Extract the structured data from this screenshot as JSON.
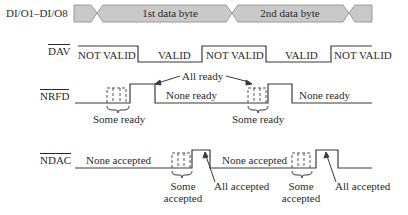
{
  "diagram": {
    "signals": {
      "data_bus": {
        "label": "DI/O1–DI/O8",
        "bytes": [
          "1st data byte",
          "2nd data byte"
        ]
      },
      "dav": {
        "label": "DAV",
        "overbar": true,
        "states": [
          "NOT VALID",
          "VALID",
          "NOT VALID",
          "VALID",
          "NOT VALID"
        ]
      },
      "nrfd": {
        "label": "NRFD",
        "overbar": true,
        "annotations": {
          "all_ready": "All ready",
          "none_ready_1": "None ready",
          "none_ready_2": "None ready",
          "some_ready_1": "Some ready",
          "some_ready_2": "Some ready"
        }
      },
      "ndac": {
        "label": "NDAC",
        "overbar": true,
        "annotations": {
          "none_accepted_1": "None accepted",
          "none_accepted_2": "None accepted",
          "some_accepted_1_a": "Some",
          "some_accepted_1_b": "accepted",
          "some_accepted_2_a": "Some",
          "some_accepted_2_b": "accepted",
          "all_accepted_1": "All accepted",
          "all_accepted_2": "All accepted"
        }
      }
    },
    "colors": {
      "line": "#3a3a3a",
      "bus_fill": "#c9c9c9",
      "bus_stroke": "#8a8a8a",
      "dashed": "#555555"
    }
  }
}
